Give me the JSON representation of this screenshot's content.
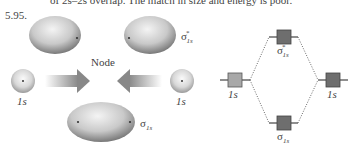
{
  "header": {
    "top_text": "of 2s–2s overlap. The match in size and energy is poor.",
    "problem_number": "5.95."
  },
  "left_figure": {
    "antibonding_label": "σ",
    "antibonding_sub": "1s",
    "antibonding_star": "*",
    "node_label": "Node",
    "atomic_left_label": "1s",
    "atomic_right_label": "1s",
    "bonding_label": "σ",
    "bonding_sub": "1s"
  },
  "right_figure": {
    "atomic_left_label": "1s",
    "atomic_right_label": "1s",
    "antibonding_label": "σ",
    "antibonding_sub": "1s",
    "antibonding_star": "*",
    "bonding_label": "σ",
    "bonding_sub": "1s",
    "colors": {
      "atomic_left_box": "#a8a8a8",
      "mo_box": "#6e6e6e",
      "atomic_right_box": "#6e6e6e",
      "lines": "#444444"
    }
  }
}
